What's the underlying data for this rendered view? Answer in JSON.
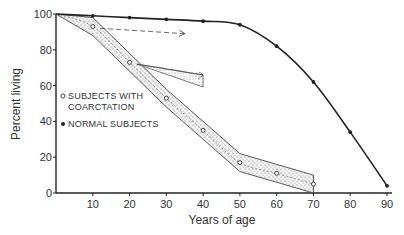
{
  "chart_data": {
    "type": "line",
    "title": "",
    "xlabel": "Years of age",
    "ylabel": "Percent living",
    "xlim": [
      0,
      90
    ],
    "ylim": [
      0,
      100
    ],
    "x_ticks": [
      10,
      20,
      30,
      40,
      50,
      60,
      70,
      80,
      90
    ],
    "y_ticks": [
      0,
      20,
      40,
      60,
      80,
      100
    ],
    "grid": false,
    "legend_position": "inside-left",
    "series": [
      {
        "name": "NORMAL SUBJECTS",
        "marker": "filled-circle",
        "x": [
          0,
          10,
          20,
          30,
          40,
          50,
          60,
          70,
          80,
          90
        ],
        "values": [
          100,
          99,
          98,
          97,
          96,
          94,
          82,
          62,
          34,
          4
        ]
      },
      {
        "name": "SUBJECTS WITH COARCTATION",
        "marker": "open-circle",
        "x": [
          0,
          10,
          20,
          30,
          40,
          50,
          60,
          70
        ],
        "values": [
          100,
          93,
          73,
          53,
          35,
          17,
          11,
          5
        ],
        "band": "stippled confidence band around curve"
      }
    ],
    "annotations": [
      {
        "type": "dashed-arrow",
        "from_x": 12,
        "from_y": 92,
        "to_x": 35,
        "to_y": 89
      },
      {
        "type": "hatched-arrow",
        "from_x": 22,
        "from_y": 72,
        "to_x": 40,
        "to_y": 62
      }
    ]
  },
  "labels": {
    "y_axis": "Percent living",
    "x_axis": "Years of age",
    "legend_coarctation_line1": "SUBJECTS WITH",
    "legend_coarctation_line2": "COARCTATION",
    "legend_normal": "NORMAL SUBJECTS",
    "y_ticks": [
      "0",
      "20",
      "40",
      "60",
      "80",
      "100"
    ],
    "x_ticks": [
      "10",
      "20",
      "30",
      "40",
      "50",
      "60",
      "70",
      "80",
      "90"
    ]
  }
}
